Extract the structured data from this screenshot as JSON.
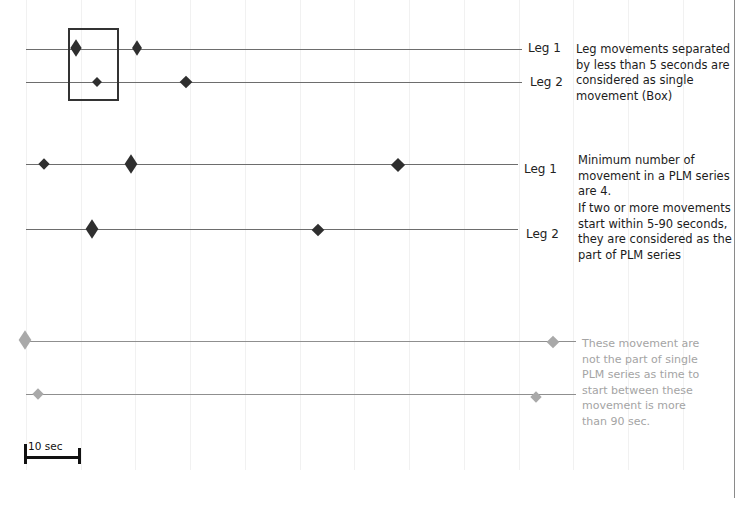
{
  "diagram": {
    "title": "",
    "panels": [
      {
        "id": "single-movement",
        "tracks": [
          {
            "label": "Leg 1",
            "y": 49,
            "x_start": 26,
            "x_end": 522,
            "color": "#6d6d6d",
            "markers": [
              {
                "x": 76,
                "size": 9,
                "tall": true
              },
              {
                "x": 137,
                "size": 8,
                "tall": true
              }
            ]
          },
          {
            "label": "Leg 2",
            "y": 82,
            "x_start": 26,
            "x_end": 522,
            "color": "#6d6d6d",
            "markers": [
              {
                "x": 97,
                "size": 7,
                "tall": false
              },
              {
                "x": 186,
                "size": 9,
                "tall": false
              }
            ]
          }
        ],
        "box": {
          "x": 68,
          "y": 28,
          "w": 50,
          "h": 73,
          "label": "Box"
        },
        "note": "Leg movements separated by less than 5 seconds are considered as single movement (Box)"
      },
      {
        "id": "plm-series",
        "tracks": [
          {
            "label": "Leg 1",
            "y": 164,
            "x_start": 26,
            "x_end": 518,
            "color": "#6d6d6d",
            "markers": [
              {
                "x": 44,
                "size": 8,
                "tall": false
              },
              {
                "x": 131,
                "size": 9,
                "tall": true
              },
              {
                "x": 398,
                "size": 10,
                "tall": false
              }
            ]
          },
          {
            "label": "Leg 2",
            "y": 229,
            "x_start": 26,
            "x_end": 518,
            "color": "#6d6d6d",
            "markers": [
              {
                "x": 92,
                "size": 9,
                "tall": true
              },
              {
                "x": 318,
                "size": 9,
                "tall": false
              }
            ]
          }
        ],
        "note_lines": [
          "Minimum number of movement in a PLM series are 4.",
          "If two or more movements start within 5-90 seconds, they are considered as the part of PLM series"
        ]
      },
      {
        "id": "not-plm-series",
        "tracks": [
          {
            "label": "",
            "y": 341,
            "x_start": 26,
            "x_end": 575,
            "color": "#8f8f8f",
            "markers": [
              {
                "x": 25,
                "size": 9,
                "tall": true
              },
              {
                "x": 553,
                "size": 9,
                "tall": false
              }
            ]
          },
          {
            "label": "",
            "y": 394,
            "x_start": 26,
            "x_end": 575,
            "color": "#8f8f8f",
            "markers": [
              {
                "x": 38,
                "size": 8,
                "tall": false
              },
              {
                "x": 536,
                "size": 8,
                "tall": false
              }
            ]
          }
        ],
        "note": "These movement are not the part of single PLM series as time to start between these movement is more than 90 sec."
      }
    ],
    "scale_bar": {
      "label": "10 sec"
    },
    "colors": {
      "dark_marker": "#2f2f2f",
      "light_marker": "#a9a9a9",
      "track_dark": "#6d6d6d",
      "track_light": "#8f8f8f",
      "light_text": "#a4a4a4"
    }
  },
  "labels": {
    "p1_leg1": "Leg 1",
    "p1_leg2": "Leg 2",
    "p2_leg1": "Leg 1",
    "p2_leg2": "Leg 2",
    "p1_note": "Leg movements separated by less than 5 seconds are considered as single movement (Box)",
    "p2_note_a": "Minimum number of movement in a PLM series are 4.",
    "p2_note_b": "If two or more movements start within 5-90 seconds, they are considered as the part of PLM series",
    "p3_note": "These movement are not the part of single PLM series as time to start between these movement is more than 90 sec.",
    "scale": "10 sec"
  }
}
